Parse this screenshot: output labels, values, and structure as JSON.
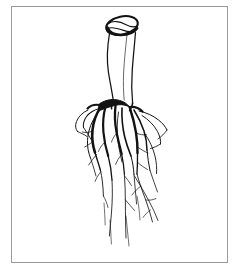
{
  "figure": {
    "subject_name": "root-system-illustration",
    "style": "black ink line art on white background",
    "background_color": "#ffffff",
    "ink_color": "#111111",
    "frame": {
      "name": "illustration-border",
      "color": "#9a9a9a",
      "stroke_width": 1,
      "x": 11,
      "y": 6,
      "width": 217,
      "height": 257
    },
    "canvas": {
      "width": 240,
      "height": 271
    }
  },
  "parts": [
    {
      "id": "crown",
      "label": "Cut crown / stem base",
      "shape": "ellipse",
      "center_x": 122,
      "center_y": 26,
      "radius_x": 16,
      "radius_y": 9,
      "rotation_deg": -12,
      "interior_lines": 2
    },
    {
      "id": "taproot-shaft",
      "label": "Main taproot shaft",
      "top_y": 33,
      "bottom_y": 108,
      "top_width": 27,
      "bottom_width": 20
    },
    {
      "id": "branch-node",
      "label": "Primary branching node",
      "x": 120,
      "y": 104
    },
    {
      "id": "lateral-roots",
      "label": "Lateral root bundle",
      "top_y": 100,
      "bottom_y": 252,
      "left_x": 66,
      "right_x": 175,
      "count": 14
    },
    {
      "id": "root-hairs",
      "label": "Fine rootlets and hairs",
      "count": 22
    }
  ]
}
